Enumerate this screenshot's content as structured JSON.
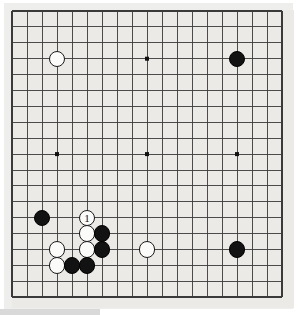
{
  "diagram": {
    "type": "go-board-diagram",
    "board_size": 19,
    "background_color": "#eceae6",
    "page_color": "#ffffff",
    "line_color": "#3a3a3a",
    "border_color": "#111111",
    "black_stone_color": "#121212",
    "white_stone_color": "#fbfbfa",
    "geometry": {
      "origin_x": 12,
      "origin_y": 11,
      "step_x": 15.0,
      "step_y": 15.9,
      "stone_radius": 8.2
    },
    "star_points": [
      {
        "col": 3,
        "row": 3
      },
      {
        "col": 9,
        "row": 3
      },
      {
        "col": 15,
        "row": 3
      },
      {
        "col": 3,
        "row": 9
      },
      {
        "col": 9,
        "row": 9
      },
      {
        "col": 15,
        "row": 9
      },
      {
        "col": 3,
        "row": 15
      },
      {
        "col": 9,
        "row": 15
      },
      {
        "col": 15,
        "row": 15
      }
    ],
    "stones": [
      {
        "col": 3,
        "row": 3,
        "color": "white",
        "label": ""
      },
      {
        "col": 15,
        "row": 3,
        "color": "black",
        "label": ""
      },
      {
        "col": 2,
        "row": 13,
        "color": "black",
        "label": ""
      },
      {
        "col": 5,
        "row": 13,
        "color": "white",
        "label": "1"
      },
      {
        "col": 5,
        "row": 14,
        "color": "white",
        "label": ""
      },
      {
        "col": 6,
        "row": 14,
        "color": "black",
        "label": ""
      },
      {
        "col": 3,
        "row": 15,
        "color": "white",
        "label": ""
      },
      {
        "col": 5,
        "row": 15,
        "color": "white",
        "label": ""
      },
      {
        "col": 6,
        "row": 15,
        "color": "black",
        "label": ""
      },
      {
        "col": 9,
        "row": 15,
        "color": "white",
        "label": ""
      },
      {
        "col": 15,
        "row": 15,
        "color": "black",
        "label": ""
      },
      {
        "col": 3,
        "row": 16,
        "color": "white",
        "label": ""
      },
      {
        "col": 4,
        "row": 16,
        "color": "black",
        "label": ""
      },
      {
        "col": 5,
        "row": 16,
        "color": "black",
        "label": ""
      }
    ],
    "move_numbers": [
      {
        "number": "1",
        "color": "white",
        "col": 5,
        "row": 13
      }
    ]
  }
}
